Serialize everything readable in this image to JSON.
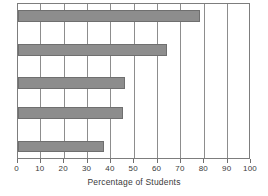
{
  "chart_data": {
    "type": "bar",
    "orientation": "horizontal",
    "title": "",
    "xlabel": "Percentage of Students",
    "ylabel": "",
    "xlim": [
      0,
      100
    ],
    "xticks": [
      0,
      10,
      20,
      30,
      40,
      50,
      60,
      70,
      80,
      90,
      100
    ],
    "xtick_labels": [
      "0",
      "10",
      "20",
      "30",
      "40",
      "50",
      "60",
      "70",
      "80",
      "90",
      "100"
    ],
    "grid": "vertical",
    "legend": null,
    "categories": [
      "",
      "",
      "",
      "",
      ""
    ],
    "values": [
      78,
      64,
      46,
      45,
      37
    ],
    "bar_color": "#8d8d8d",
    "bar_edge_color": "#6f6f6f",
    "frame_color": "#7d7d7d",
    "background_color": "#ffffff",
    "text_color": "#3a3a3a"
  }
}
